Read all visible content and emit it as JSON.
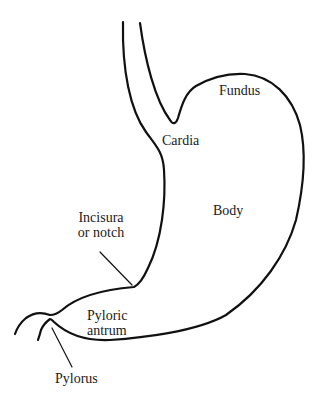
{
  "diagram": {
    "stroke_color": "#111111",
    "background": "#ffffff",
    "labels": {
      "fundus": "Fundus",
      "cardia": "Cardia",
      "body": "Body",
      "incisura_line1": "Incisura",
      "incisura_line2": "or notch",
      "pyloric_line1": "Pyloric",
      "pyloric_line2": "antrum",
      "pylorus": "Pylorus"
    }
  }
}
